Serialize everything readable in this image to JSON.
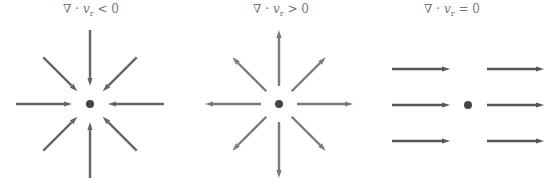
{
  "panels": [
    {
      "id": "converging",
      "label": {
        "prefix": "∇ · ",
        "var": "v",
        "sub": "r",
        "rel": "< 0"
      },
      "arrow_direction": "inward",
      "arrow_color": "#666666",
      "arrows": 8
    },
    {
      "id": "diverging",
      "label": {
        "prefix": "∇ · ",
        "var": "v",
        "sub": "r",
        "rel": "> 0"
      },
      "arrow_direction": "outward",
      "arrow_color": "#7a7a7a",
      "arrows": 8
    },
    {
      "id": "uniform",
      "label": {
        "prefix": "∇ · ",
        "var": "v",
        "sub": "r",
        "rel": "= 0"
      },
      "arrow_direction": "rightward",
      "arrow_color": "#555555",
      "arrows": 6
    }
  ],
  "colors": {
    "dot": "#444444",
    "label": "#777777"
  }
}
